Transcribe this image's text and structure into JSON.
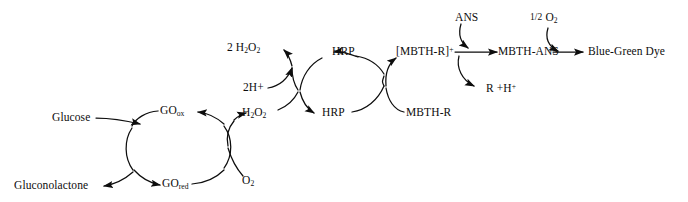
{
  "diagram": {
    "type": "reaction-scheme",
    "title": "",
    "background_color": "#ffffff",
    "stroke_color": "#0d0d0d",
    "species": {
      "glucose": "Glucose",
      "gluconolactone": "Gluconolactone",
      "go_ox": "GO",
      "go_ox_sub": "ox",
      "go_red": "GO",
      "go_red_sub": "red",
      "oxygen": "O",
      "oxygen_sub": "2",
      "hydrogen_peroxide": "H",
      "hydrogen_peroxide_sub1": "2",
      "hydrogen_peroxide_mid": "O",
      "hydrogen_peroxide_sub2": "2",
      "two_water_prefix": "2 H",
      "two_water_sub1": "2",
      "two_water_mid": "O",
      "two_water_sub2": "2",
      "two_protons": "2H+",
      "hrp_ox": "HRP",
      "hrp_red": "HRP",
      "mbth_r": "MBTH-R",
      "mbth_r_cation": "[MBTH-R]",
      "mbth_r_cation_sup": "+",
      "ans": "ANS",
      "mbth_ans": "MBTH-ANS",
      "r_plus_proton": "R +H",
      "r_plus_proton_sup": "+",
      "half_oxygen_frac": "1/2",
      "half_oxygen": "O",
      "half_oxygen_sub": "2",
      "blue_green_dye": "Blue-Green Dye"
    },
    "cycles": [
      {
        "name": "glucose-oxidase-cycle",
        "enzyme_oxidized": "GOox",
        "enzyme_reduced": "GOred",
        "substrate_in": "Glucose",
        "product_out": "Gluconolactone"
      },
      {
        "name": "oxygen-peroxide-cycle",
        "substrate_in": "O2",
        "product_out": "H2O2"
      },
      {
        "name": "hrp-peroxide-cycle",
        "substrate_in": "H2O2",
        "cosubstrate_in": "2H+",
        "product_out": "2 H2O2",
        "enzyme_oxidized": "HRP",
        "enzyme_reduced": "HRP"
      },
      {
        "name": "mbth-cycle",
        "substrate_in": "MBTH-R",
        "product_out": "[MBTH-R]+"
      },
      {
        "name": "ans-coupling",
        "substrate_in": "ANS",
        "product_out": "R +H+",
        "product_main": "MBTH-ANS"
      }
    ],
    "terminal_step": {
      "reactant": "MBTH-ANS",
      "cosubstrate": "1/2 O2",
      "product": "Blue-Green Dye"
    }
  }
}
